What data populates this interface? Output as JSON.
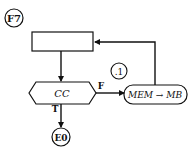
{
  "diagram": {
    "type": "flowchart",
    "entry_connector": {
      "label": "F7"
    },
    "process_box": {
      "label": ""
    },
    "decision": {
      "label": "CC"
    },
    "true_branch": {
      "label": "T"
    },
    "false_branch": {
      "label": "F"
    },
    "action": {
      "label": "MEM → MB"
    },
    "note_connector": {
      "label": ".1"
    },
    "exit_connector": {
      "label": "E0"
    }
  },
  "colors": {
    "stroke": "#111111",
    "background": "#ffffff"
  }
}
